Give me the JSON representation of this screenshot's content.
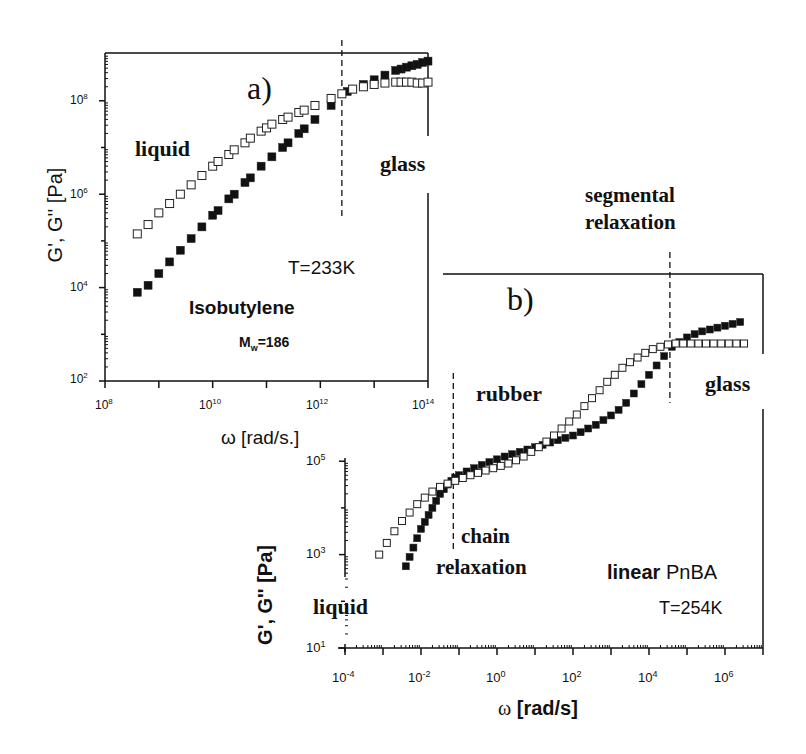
{
  "chart_data": [
    {
      "id": "a",
      "type": "scatter",
      "panel_label": "a)",
      "title": "",
      "xlabel": "ω [rad/s.]",
      "ylabel": "G', G'' [Pa]",
      "xscale": "log",
      "yscale": "log",
      "xlim": [
        100000000.0,
        100000000000000.0
      ],
      "ylim": [
        100.0,
        1000000000.0
      ],
      "xticks": [
        "10^8",
        "10^10",
        "10^12",
        "10^14"
      ],
      "yticks": [
        "10^2",
        "10^4",
        "10^6",
        "10^8"
      ],
      "vlines": [
        {
          "x_log10": 12.4,
          "style": "dashed"
        }
      ],
      "annotations": [
        "liquid",
        "glass",
        "T=233K",
        "Isobutylene",
        "Mw=186"
      ],
      "series": [
        {
          "name": "G' (storage modulus)",
          "marker": "filled-square",
          "x_log10": [
            8.6,
            8.8,
            9.0,
            9.2,
            9.4,
            9.6,
            9.8,
            10.0,
            10.1,
            10.3,
            10.4,
            10.6,
            10.7,
            10.9,
            11.1,
            11.3,
            11.4,
            11.6,
            11.7,
            11.9,
            12.2,
            12.5,
            12.8,
            13.0,
            13.2,
            13.4,
            13.5,
            13.6,
            13.7,
            13.8,
            13.9,
            14.0
          ],
          "y_log10": [
            3.9,
            4.05,
            4.3,
            4.55,
            4.8,
            5.05,
            5.3,
            5.55,
            5.65,
            5.9,
            6.0,
            6.25,
            6.35,
            6.6,
            6.8,
            7.0,
            7.1,
            7.3,
            7.4,
            7.6,
            7.9,
            8.2,
            8.35,
            8.45,
            8.55,
            8.65,
            8.68,
            8.72,
            8.75,
            8.78,
            8.82,
            8.85
          ]
        },
        {
          "name": "G'' (loss modulus)",
          "marker": "open-square",
          "x_log10": [
            8.6,
            8.8,
            9.0,
            9.2,
            9.4,
            9.6,
            9.8,
            10.0,
            10.1,
            10.3,
            10.4,
            10.6,
            10.7,
            10.9,
            11.0,
            11.1,
            11.3,
            11.4,
            11.6,
            11.7,
            11.9,
            12.2,
            12.4,
            12.6,
            12.8,
            13.0,
            13.2,
            13.4,
            13.5,
            13.6,
            13.7,
            13.8,
            13.9,
            14.0
          ],
          "y_log10": [
            5.15,
            5.35,
            5.6,
            5.8,
            6.0,
            6.2,
            6.4,
            6.6,
            6.7,
            6.85,
            6.95,
            7.1,
            7.2,
            7.35,
            7.42,
            7.5,
            7.6,
            7.65,
            7.75,
            7.8,
            7.9,
            8.05,
            8.15,
            8.25,
            8.3,
            8.35,
            8.38,
            8.4,
            8.4,
            8.4,
            8.4,
            8.38,
            8.38,
            8.4
          ]
        }
      ]
    },
    {
      "id": "b",
      "type": "scatter",
      "panel_label": "b)",
      "title": "",
      "xlabel": "ω [rad/s]",
      "ylabel": "G', G'' [Pa]",
      "xscale": "log",
      "yscale": "log",
      "xlim": [
        0.0001,
        10000000.0
      ],
      "ylim": [
        10.0,
        1000000000.0
      ],
      "xticks": [
        "10^-4",
        "10^-2",
        "10^0",
        "10^2",
        "10^4",
        "10^6"
      ],
      "yticks": [
        "10^1",
        "10^3",
        "10^5"
      ],
      "vlines": [
        {
          "x_log10": -1.15,
          "style": "dashed",
          "label": "chain relaxation"
        },
        {
          "x_log10": 4.55,
          "style": "dashed",
          "label": "segmental relaxation"
        }
      ],
      "annotations": [
        "rubber",
        "glass",
        "liquid",
        "chain relaxation",
        "segmental relaxation",
        "linear PnBA",
        "T=254K"
      ],
      "series": [
        {
          "name": "G' (storage modulus)",
          "marker": "filled-square",
          "x_log10": [
            -2.4,
            -2.3,
            -2.2,
            -2.1,
            -2.0,
            -1.9,
            -1.8,
            -1.7,
            -1.6,
            -1.5,
            -1.4,
            -1.3,
            -1.2,
            -1.1,
            -1.0,
            -0.8,
            -0.6,
            -0.4,
            -0.2,
            0.0,
            0.2,
            0.4,
            0.6,
            0.8,
            1.0,
            1.2,
            1.4,
            1.6,
            1.8,
            2.0,
            2.2,
            2.4,
            2.6,
            2.8,
            3.0,
            3.2,
            3.4,
            3.6,
            3.8,
            4.0,
            4.2,
            4.4,
            4.6,
            4.8,
            5.0,
            5.2,
            5.4,
            5.6,
            5.8,
            6.0,
            6.2,
            6.4
          ],
          "y_log10": [
            2.75,
            2.95,
            3.15,
            3.35,
            3.55,
            3.7,
            3.85,
            4.0,
            4.15,
            4.3,
            4.4,
            4.5,
            4.58,
            4.65,
            4.7,
            4.78,
            4.85,
            4.92,
            4.98,
            5.04,
            5.1,
            5.15,
            5.2,
            5.25,
            5.3,
            5.35,
            5.4,
            5.45,
            5.5,
            5.55,
            5.62,
            5.7,
            5.78,
            5.88,
            5.98,
            6.1,
            6.25,
            6.45,
            6.65,
            6.85,
            7.05,
            7.25,
            7.45,
            7.55,
            7.65,
            7.72,
            7.78,
            7.82,
            7.86,
            7.9,
            7.94,
            7.98
          ]
        },
        {
          "name": "G'' (loss modulus)",
          "marker": "open-square",
          "x_log10": [
            -3.1,
            -2.9,
            -2.7,
            -2.5,
            -2.3,
            -2.1,
            -1.9,
            -1.7,
            -1.5,
            -1.3,
            -1.1,
            -0.9,
            -0.7,
            -0.5,
            -0.3,
            -0.1,
            0.1,
            0.3,
            0.5,
            0.7,
            0.9,
            1.1,
            1.3,
            1.5,
            1.7,
            1.9,
            2.1,
            2.3,
            2.5,
            2.7,
            2.9,
            3.1,
            3.3,
            3.5,
            3.7,
            3.9,
            4.1,
            4.3,
            4.5,
            4.7,
            4.9,
            5.1,
            5.3,
            5.5,
            5.7,
            5.9,
            6.1,
            6.3,
            6.5
          ],
          "y_log10": [
            3.0,
            3.25,
            3.5,
            3.72,
            3.9,
            4.08,
            4.22,
            4.35,
            4.45,
            4.52,
            4.58,
            4.64,
            4.7,
            4.75,
            4.8,
            4.85,
            4.9,
            4.95,
            5.02,
            5.1,
            5.2,
            5.3,
            5.42,
            5.55,
            5.7,
            5.85,
            6.0,
            6.18,
            6.35,
            6.52,
            6.7,
            6.85,
            7.0,
            7.12,
            7.22,
            7.32,
            7.4,
            7.45,
            7.5,
            7.52,
            7.52,
            7.52,
            7.52,
            7.52,
            7.52,
            7.52,
            7.52,
            7.52,
            7.52
          ]
        }
      ]
    }
  ],
  "panel_a": {
    "label": "a)",
    "ylabel": "G', G'' [Pa]",
    "xlabel": "ω [rad/s.]",
    "xtick_base": "10",
    "xticks": [
      {
        "exp": "8"
      },
      {
        "exp": "10"
      },
      {
        "exp": "12"
      },
      {
        "exp": "14"
      }
    ],
    "yticks": [
      {
        "exp": "2"
      },
      {
        "exp": "4"
      },
      {
        "exp": "6"
      },
      {
        "exp": "8"
      }
    ],
    "text_liquid": "liquid",
    "text_glass": "glass",
    "text_temp": "T=233K",
    "text_material": "Isobutylene",
    "text_mw_main": "M",
    "text_mw_sub": "w",
    "text_mw_val": "=186"
  },
  "panel_b": {
    "label": "b)",
    "ylabel": "G', G'' [Pa]",
    "xlabel_omega": "ω",
    "xlabel_unit": "[rad/s]",
    "xticks": [
      {
        "exp": "-4"
      },
      {
        "exp": "-2"
      },
      {
        "exp": "0"
      },
      {
        "exp": "2"
      },
      {
        "exp": "4"
      },
      {
        "exp": "6"
      }
    ],
    "yticks": [
      {
        "exp": "1"
      },
      {
        "exp": "3"
      },
      {
        "exp": "5"
      }
    ],
    "text_rubber": "rubber",
    "text_glass": "glass",
    "text_liquid": "liquid",
    "text_chain_1": "chain",
    "text_chain_2": "relaxation",
    "text_seg_1": "segmental",
    "text_seg_2": "relaxation",
    "text_linear": "linear",
    "text_pnba": "PnBA",
    "text_temp": "T=254K"
  }
}
